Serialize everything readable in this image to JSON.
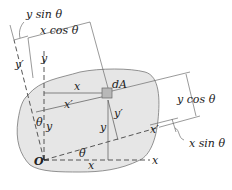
{
  "figure": {
    "colors": {
      "area_fill": "#e6e6e6",
      "area_stroke": "#777777",
      "line": "#555555",
      "element_fill": "#b8b8b8",
      "text": "#222222"
    },
    "labels": {
      "y_sin": "y sin θ",
      "x_cos": "x cos θ",
      "y_prime_left": "y′",
      "y_axis": "y",
      "dA": "dA",
      "x_top": "x",
      "x_prime_mid": "x′",
      "theta_left": "θ",
      "y_left": "y",
      "y_prime_element": "y′",
      "y_element": "y",
      "y_cos": "y cos θ",
      "x_prime_axis": "x′",
      "x_sin": "x sin θ",
      "origin": "O",
      "theta_bottom": "θ",
      "x_bottom": "x",
      "x_axis": "x"
    }
  }
}
